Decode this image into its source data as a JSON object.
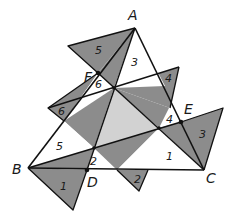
{
  "diagram": {
    "type": "geometry-figure",
    "colors": {
      "dark_fill": "#8c8c8c",
      "light_fill": "#d2d2d2",
      "stroke": "#111111",
      "background": "#ffffff"
    },
    "vertices": {
      "A": "A",
      "B": "B",
      "C": "C",
      "D": "D",
      "E": "E",
      "F": "F"
    },
    "region_labels": {
      "r5_top": "5",
      "r3_top": "3",
      "r6_mid": "6",
      "r4_top": "4",
      "r6_left": "6",
      "r4_mid": "4",
      "r3_right": "3",
      "r5_left": "5",
      "r2_mid": "2",
      "r1_right": "1",
      "r1_bottom": "1",
      "r2_bottom": "2"
    }
  }
}
